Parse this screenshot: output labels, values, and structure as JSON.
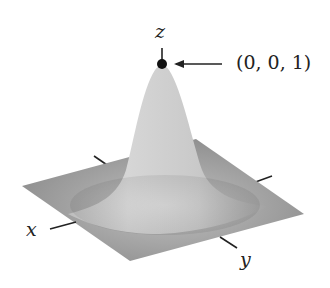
{
  "figure": {
    "axes": {
      "x_label": "x",
      "y_label": "y",
      "z_label": "z"
    },
    "annotation": {
      "point_label": "(0, 0, 1)",
      "point": [
        0,
        0,
        1
      ],
      "arrow": "points left toward the peak"
    },
    "colors": {
      "surface_light": "#d4d4d4",
      "surface_dark": "#8e8e8e",
      "axis": "#222222",
      "point": "#111111"
    }
  }
}
